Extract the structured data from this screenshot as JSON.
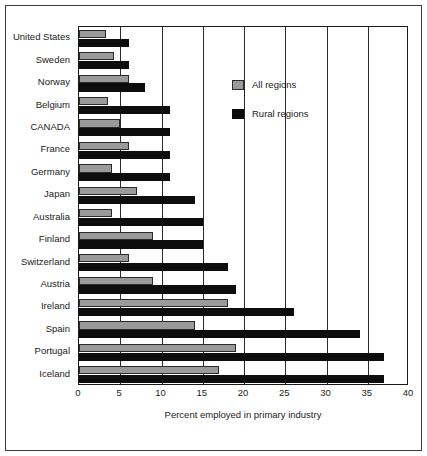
{
  "chart_data": {
    "type": "bar",
    "orientation": "horizontal",
    "title": "",
    "xlabel": "Percent employed in primary industry",
    "ylabel": "",
    "xlim": [
      0,
      40
    ],
    "xticks": [
      0,
      5,
      10,
      15,
      20,
      25,
      30,
      35,
      40
    ],
    "grid": true,
    "legend_position": "top-right",
    "categories": [
      "United States",
      "Sweden",
      "Norway",
      "Belgium",
      "CANADA",
      "France",
      "Germany",
      "Japan",
      "Australia",
      "Finland",
      "Switzerland",
      "Austria",
      "Ireland",
      "Spain",
      "Portugal",
      "Iceland"
    ],
    "series": [
      {
        "name": "All regions",
        "color": "#9a9a9a",
        "values": [
          3.3,
          4.2,
          6.0,
          3.5,
          5.0,
          6.0,
          4.0,
          7.0,
          4.0,
          9.0,
          6.0,
          9.0,
          18.0,
          14.0,
          19.0,
          17.0
        ]
      },
      {
        "name": "Rural regions",
        "color": "#0d0d0d",
        "values": [
          6.0,
          6.0,
          8.0,
          11.0,
          11.0,
          11.0,
          11.0,
          14.0,
          15.0,
          15.0,
          18.0,
          19.0,
          26.0,
          34.0,
          37.0,
          37.0
        ]
      }
    ]
  },
  "legend": {
    "items": [
      {
        "label": "All regions",
        "swatch": "all"
      },
      {
        "label": "Rural regions",
        "swatch": "rural"
      }
    ]
  }
}
